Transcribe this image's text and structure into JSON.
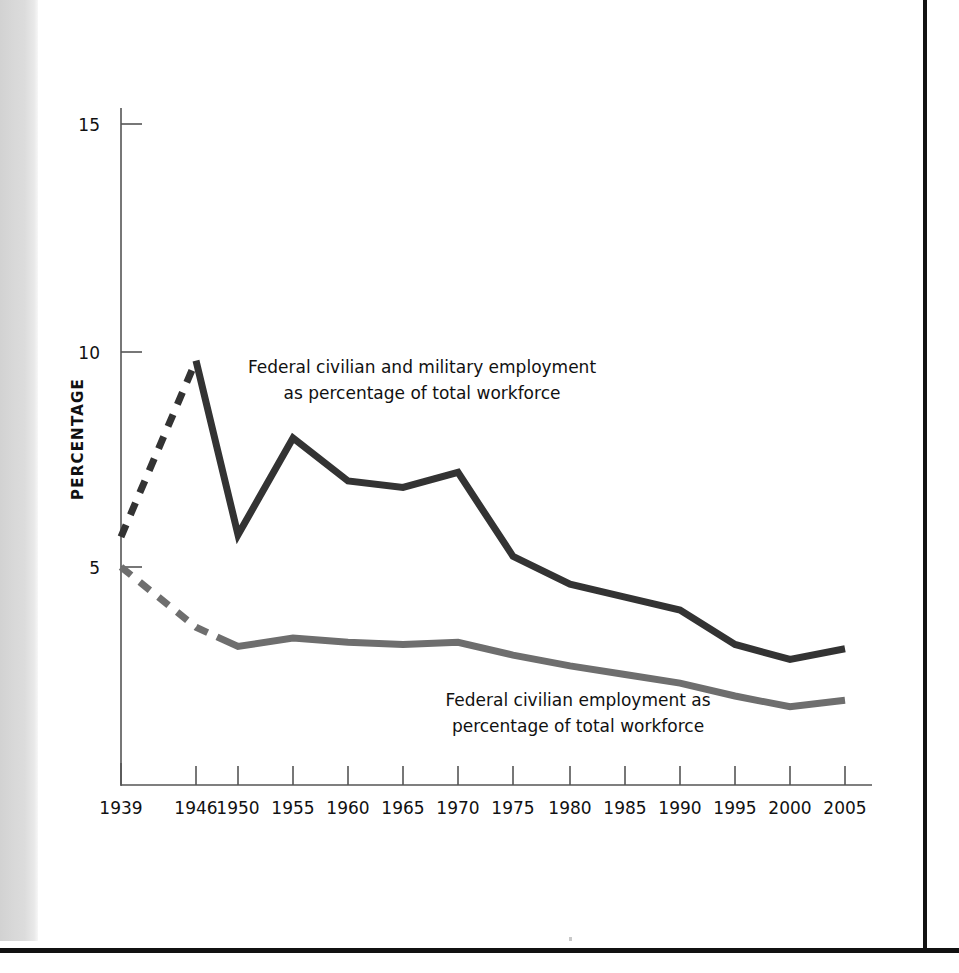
{
  "page": {
    "background_color": "#ffffff",
    "gutter_shadow_color": "#d6d6d6",
    "page_edge_color": "#111111"
  },
  "chart_data": {
    "type": "line",
    "title": "",
    "subtitle": "",
    "xlabel": "",
    "ylabel": "PERCENTAGE",
    "xlim": [
      1939,
      2005
    ],
    "ylim": [
      0,
      15.8
    ],
    "y_ticks": [
      5,
      10,
      15
    ],
    "y_tick_labels": [
      "5",
      "10",
      "15"
    ],
    "x_ticks": [
      1939,
      1946,
      1950,
      1955,
      1960,
      1965,
      1970,
      1975,
      1980,
      1985,
      1990,
      1995,
      2000,
      2005
    ],
    "x_tick_labels": [
      "1939",
      "1946",
      "1950",
      "1955",
      "1960",
      "1965",
      "1970",
      "1975",
      "1980",
      "1985",
      "1990",
      "1995",
      "2000",
      "2005"
    ],
    "grid": false,
    "legend_position": "inline-annotation",
    "categories": [
      1939,
      1946,
      1950,
      1955,
      1960,
      1965,
      1970,
      1975,
      1980,
      1985,
      1990,
      1995,
      2000,
      2005
    ],
    "series": [
      {
        "name": "Federal civilian and military employment as percentage of total workforce",
        "color": "#333333",
        "line_width": 7,
        "values": [
          5.7,
          9.8,
          5.75,
          8.0,
          7.0,
          6.85,
          7.2,
          5.25,
          4.6,
          4.3,
          4.0,
          3.2,
          2.85,
          3.1
        ],
        "dashed_from": 1939,
        "dashed_to": 1946
      },
      {
        "name": "Federal civilian employment as percentage of total workforce",
        "color": "#6e6e6e",
        "line_width": 7,
        "values": [
          5.0,
          3.6,
          3.15,
          3.35,
          3.25,
          3.2,
          3.25,
          2.95,
          2.7,
          2.5,
          2.3,
          2.0,
          1.75,
          1.9
        ],
        "dashed_from": 1939,
        "dashed_to": 1948
      }
    ],
    "annotations": [
      {
        "id": "top",
        "text": "Federal civilian and military employment\nas percentage of total workforce",
        "series": "Federal civilian and military employment as percentage of total workforce"
      },
      {
        "id": "bottom",
        "text": "Federal civilian employment as\npercentage of total workforce",
        "series": "Federal civilian employment as percentage of total workforce"
      }
    ]
  },
  "axis": {
    "y_title": "PERCENTAGE",
    "y_tick_labels": [
      "15",
      "10",
      "5"
    ],
    "x_tick_labels": [
      "1939",
      "1946",
      "1950",
      "1955",
      "1960",
      "1965",
      "1970",
      "1975",
      "1980",
      "1985",
      "1990",
      "1995",
      "2000",
      "2005"
    ],
    "axis_color": "#555555"
  },
  "annotations": {
    "top": "Federal civilian and military employment\nas percentage of total workforce",
    "bottom": "Federal civilian employment as\npercentage of total workforce"
  }
}
